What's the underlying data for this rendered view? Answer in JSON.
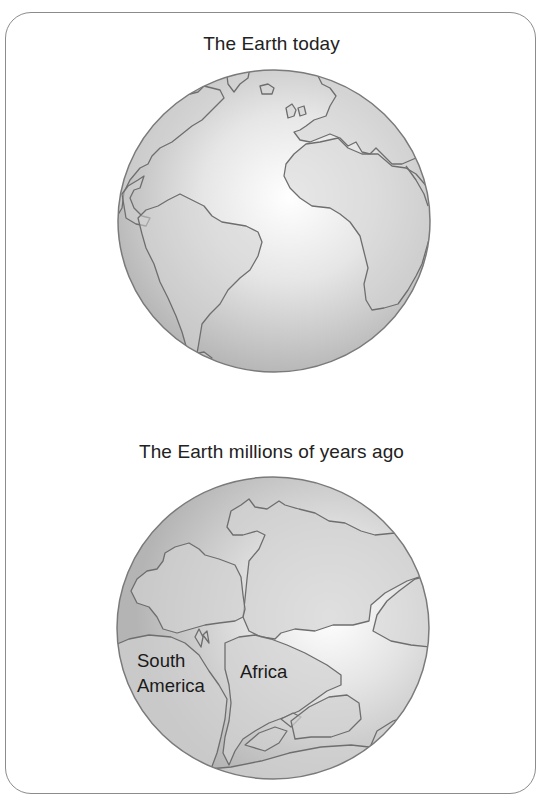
{
  "panels": [
    {
      "title": "The Earth today",
      "continents_shown": [
        "North America",
        "South America",
        "Europe",
        "Africa",
        "Greenland"
      ]
    },
    {
      "title": "The Earth millions of years ago",
      "labels": {
        "south_america_line1": "South",
        "south_america_line2": "America",
        "africa": "Africa"
      }
    }
  ],
  "colors": {
    "ocean_highlight": "#ffffff",
    "ocean_edge": "#b4b4b4",
    "land_fill": "#d2d2d2",
    "coastline": "#6e6e6e",
    "frame_border": "#8c8c8c",
    "text": "#222222"
  }
}
